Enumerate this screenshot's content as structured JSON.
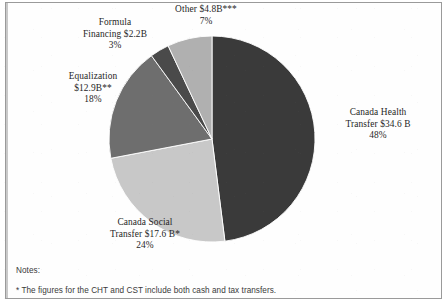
{
  "figure": {
    "notes_heading": "Notes:",
    "note_1": "* The figures for the CHT and CST include both cash and tax transfers."
  },
  "labels": {
    "other": {
      "line1": "Other $4.8B***",
      "line2": "7%"
    },
    "formula": {
      "line1": "Formula",
      "line2": "Financing $2.2B",
      "line3": "3%"
    },
    "equalization": {
      "line1": "Equalization",
      "line2": "$12.9B**",
      "line3": "18%"
    },
    "health": {
      "line1": "Canada Health",
      "line2": "Transfer $34.6 B",
      "line3": "48%"
    },
    "social": {
      "line1": "Canada Social",
      "line2": "Transfer $17.6 B*",
      "line3": "24%"
    }
  },
  "chart_data": {
    "type": "pie",
    "title": "",
    "legend_position": "callout-labels",
    "grid": false,
    "unit": "billions of dollars (CAD)",
    "total_value": 72.1,
    "categories": [
      "Canada Health Transfer",
      "Canada Social Transfer",
      "Equalization",
      "Formula Financing",
      "Other"
    ],
    "values": [
      34.6,
      17.6,
      12.9,
      2.2,
      4.8
    ],
    "percentages": [
      48,
      24,
      18,
      3,
      7
    ],
    "value_labels": [
      "$34.6 B",
      "$17.6 B*",
      "$12.9B**",
      "$2.2B",
      "$4.8B***"
    ],
    "percent_labels": [
      "48%",
      "24%",
      "18%",
      "3%",
      "7%"
    ],
    "footnote_markers": [
      "",
      "*",
      "**",
      "",
      "***"
    ],
    "colors": [
      "#3a3a3a",
      "#c8c8c8",
      "#6e6e6e",
      "#4a4a4a",
      "#b0b0b0"
    ],
    "start_angle_deg": 0,
    "direction": "clockwise",
    "annotations": [
      "* The figures for the CHT and CST include both cash and tax transfers."
    ]
  },
  "geometry": {
    "center_x": 212,
    "center_y": 139,
    "radius": 103
  }
}
